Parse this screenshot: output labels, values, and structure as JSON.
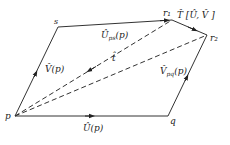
{
  "diagram": {
    "points": {
      "p": {
        "label": "p",
        "x": 15,
        "y": 116
      },
      "q": {
        "label": "q",
        "x": 168,
        "y": 116
      },
      "s": {
        "label": "s",
        "x": 58,
        "y": 27
      },
      "r1": {
        "label": "r₁",
        "x": 172,
        "y": 20
      },
      "r2": {
        "label": "r₂",
        "x": 207,
        "y": 35
      }
    },
    "edge_labels": {
      "U": "Û(p)",
      "V": "V̂(p)",
      "Ups": "Û",
      "Ups_sub": "ps",
      "Ups_arg": "(p)",
      "Vpq": "V̂",
      "Vpq_sub": "pq",
      "Vpq_arg": "(p)",
      "t": "t̂",
      "T": "T̂ [Û, V̂ ]"
    },
    "colors": {
      "stroke": "#333333",
      "text": "#222222"
    }
  }
}
